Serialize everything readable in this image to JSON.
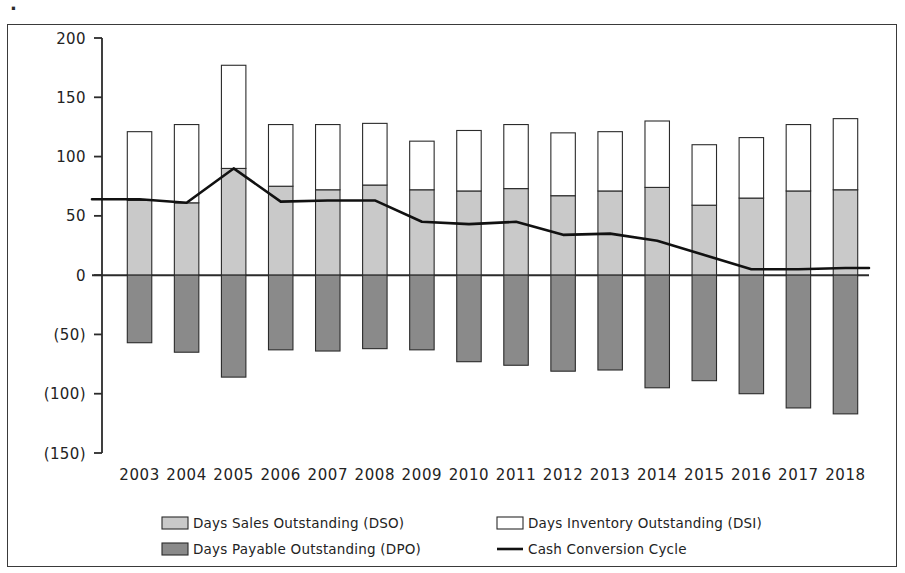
{
  "figure": {
    "scan_mark": "·",
    "background_color": "#ffffff",
    "frame_color": "#3a3a3a"
  },
  "colors": {
    "dso_fill": "#c9c9c9",
    "dsi_fill": "#ffffff",
    "dpo_fill": "#8a8a8a",
    "bar_stroke": "#2b2b2b",
    "line_color": "#111111",
    "axis_color": "#2b2b2b",
    "text_color": "#232323"
  },
  "legend": {
    "position": "bottom",
    "items": [
      {
        "label": "Days Sales Outstanding (DSO)",
        "marker": "swatch",
        "color": "#c9c9c9"
      },
      {
        "label": "Days Inventory Outstanding (DSI)",
        "marker": "swatch",
        "color": "#ffffff"
      },
      {
        "label": "Days Payable Outstanding (DPO)",
        "marker": "swatch",
        "color": "#8a8a8a"
      },
      {
        "label": "Cash Conversion Cycle",
        "marker": "line",
        "color": "#111111"
      }
    ]
  },
  "chart_data": {
    "type": "bar",
    "title": "",
    "subtitle": "",
    "xlabel": "",
    "ylabel": "",
    "grid": false,
    "legend_position": "bottom",
    "ylim": [
      -150,
      200
    ],
    "ytick_values": [
      200,
      150,
      100,
      50,
      0,
      -50,
      -100,
      -150
    ],
    "ytick_labels": [
      "200",
      "150",
      "100",
      "50",
      "0",
      "(50)",
      "(100)",
      "(150)"
    ],
    "categories": [
      "2003",
      "2004",
      "2005",
      "2006",
      "2007",
      "2008",
      "2009",
      "2010",
      "2011",
      "2012",
      "2013",
      "2014",
      "2015",
      "2016",
      "2017",
      "2018"
    ],
    "series": [
      {
        "name": "Days Sales Outstanding (DSO)",
        "kind": "bar",
        "stack": "positive",
        "color": "#c9c9c9",
        "values": [
          63,
          61,
          90,
          75,
          72,
          76,
          72,
          71,
          73,
          67,
          71,
          74,
          59,
          65,
          71,
          72
        ]
      },
      {
        "name": "Days Inventory Outstanding (DSI)",
        "kind": "bar",
        "stack": "positive",
        "color": "#ffffff",
        "values": [
          58,
          66,
          87,
          52,
          55,
          52,
          41,
          51,
          54,
          53,
          50,
          56,
          51,
          51,
          56,
          60
        ]
      },
      {
        "name": "Days Payable Outstanding (DPO)",
        "kind": "bar",
        "stack": "negative",
        "color": "#8a8a8a",
        "values": [
          -57,
          -65,
          -86,
          -63,
          -64,
          -62,
          -63,
          -73,
          -76,
          -81,
          -80,
          -95,
          -89,
          -100,
          -112,
          -117
        ]
      },
      {
        "name": "Cash Conversion Cycle",
        "kind": "line",
        "color": "#111111",
        "values": [
          64,
          61,
          90,
          62,
          63,
          63,
          45,
          43,
          45,
          34,
          35,
          29,
          17,
          5,
          5,
          6
        ]
      }
    ],
    "stacked_totals": [
      121,
      127,
      177,
      127,
      127,
      128,
      113,
      122,
      127,
      120,
      121,
      130,
      110,
      116,
      127,
      132
    ]
  }
}
